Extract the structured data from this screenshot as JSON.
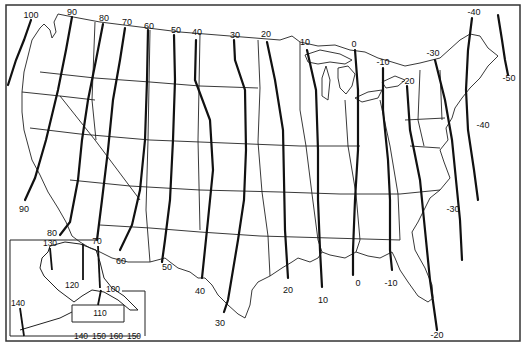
{
  "map": {
    "type": "contour-map",
    "region": "Contiguous United States with Alaska inset",
    "frame_color": "#333333",
    "line_color": "#111111",
    "border_color": "#222222",
    "background": "#ffffff"
  },
  "contours": [
    {
      "value": "100",
      "top_label": "100",
      "bottom_label": ""
    },
    {
      "value": "90",
      "top_label": "90",
      "bottom_label": "90"
    },
    {
      "value": "80",
      "top_label": "80",
      "bottom_label": "80"
    },
    {
      "value": "70",
      "top_label": "70",
      "bottom_label": "70"
    },
    {
      "value": "60",
      "top_label": "60",
      "bottom_label": "60"
    },
    {
      "value": "50",
      "top_label": "50",
      "bottom_label": "50"
    },
    {
      "value": "40",
      "top_label": "40",
      "bottom_label": "40"
    },
    {
      "value": "30",
      "top_label": "30",
      "bottom_label": "30"
    },
    {
      "value": "20",
      "top_label": "20",
      "bottom_label": "20"
    },
    {
      "value": "10",
      "top_label": "10",
      "bottom_label": "10"
    },
    {
      "value": "0",
      "top_label": "0",
      "bottom_label": "0"
    },
    {
      "value": "-10",
      "top_label": "-10",
      "bottom_label": "-10"
    },
    {
      "value": "-20",
      "top_label": "-20",
      "bottom_label": "-20"
    },
    {
      "value": "-30",
      "top_label": "-30",
      "bottom_label": "-30"
    },
    {
      "value": "-40",
      "top_label": "-40",
      "bottom_label": "-40"
    },
    {
      "value": "-50",
      "top_label": "",
      "bottom_label": "-50"
    }
  ],
  "labels": {
    "l100": "100",
    "l90t": "90",
    "l80t": "80",
    "l70t": "70",
    "l60t": "60",
    "l50t": "50",
    "l40t": "40",
    "l30t": "30",
    "l20t": "20",
    "l10t": "10",
    "l0t": "0",
    "lm10t": "-10",
    "lm20t": "-20",
    "lm30t": "-30",
    "lm40t": "-40",
    "lm50": "-50",
    "l90b": "90",
    "l80b": "80",
    "l60b": "60",
    "l50b": "50",
    "l40b": "40",
    "l30b": "30",
    "l20b": "20",
    "l10b": "10",
    "l0b": "0",
    "lm10b": "-10",
    "lm20b": "-20",
    "lm30b": "-30",
    "lm40b": "-40"
  },
  "alaska_inset": {
    "labels": {
      "a130": "130",
      "a70": "70",
      "a120": "120",
      "a100": "100",
      "a110": "110",
      "a140": "140",
      "bottom_scale": [
        "140",
        "150",
        "160",
        "150"
      ]
    }
  }
}
